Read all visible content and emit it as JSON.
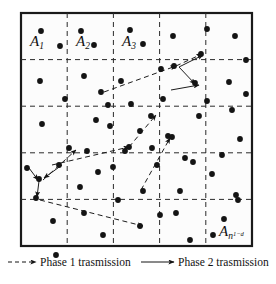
{
  "figure": {
    "type": "network-diagram",
    "frame": {
      "x": 21,
      "y": 13,
      "width": 231,
      "height": 233,
      "stroke_color": "#1a1a1a",
      "stroke_width": 2.2,
      "fill_color": "#fcfcfc"
    },
    "grid": {
      "rows": 5,
      "columns": 5,
      "line_style": "dashed",
      "stroke_color": "#2b2b2b",
      "dash_pattern": "5,4",
      "vertical_lines_x": [
        67.2,
        113.4,
        159.6,
        205.8
      ],
      "horizontal_lines_y": [
        59.6,
        106.2,
        152.8,
        199.4
      ]
    },
    "cell_labels": [
      {
        "id": "A1",
        "base": "A",
        "sub": "1",
        "subsup": "",
        "x": 30,
        "y": 46
      },
      {
        "id": "A2",
        "base": "A",
        "sub": "2",
        "subsup": "",
        "x": 76,
        "y": 46
      },
      {
        "id": "A3",
        "base": "A",
        "sub": "3",
        "subsup": "",
        "x": 122,
        "y": 46
      },
      {
        "id": "An",
        "base": "A",
        "sub": "n",
        "subsup": "1−d",
        "x": 219,
        "y": 236
      }
    ],
    "nodes": {
      "radius": 2.9,
      "color": "#141414",
      "count": 71,
      "points": [
        [
          41,
          31
        ],
        [
          60,
          46
        ],
        [
          81,
          31
        ],
        [
          94,
          45
        ],
        [
          130,
          30
        ],
        [
          143,
          44
        ],
        [
          173,
          36
        ],
        [
          201,
          54
        ],
        [
          207,
          29
        ],
        [
          235,
          36
        ],
        [
          40,
          81
        ],
        [
          84,
          76
        ],
        [
          101,
          92
        ],
        [
          65,
          99
        ],
        [
          121,
          81
        ],
        [
          108,
          105
        ],
        [
          161,
          69
        ],
        [
          174,
          66
        ],
        [
          195,
          83
        ],
        [
          229,
          82
        ],
        [
          246,
          94
        ],
        [
          42,
          124
        ],
        [
          110,
          126
        ],
        [
          140,
          131
        ],
        [
          129,
          147
        ],
        [
          152,
          148
        ],
        [
          163,
          99
        ],
        [
          172,
          137
        ],
        [
          185,
          158
        ],
        [
          199,
          116
        ],
        [
          240,
          139
        ],
        [
          27,
          168
        ],
        [
          39,
          179
        ],
        [
          59,
          165
        ],
        [
          80,
          187
        ],
        [
          98,
          172
        ],
        [
          125,
          151
        ],
        [
          143,
          191
        ],
        [
          180,
          191
        ],
        [
          212,
          174
        ],
        [
          236,
          195
        ],
        [
          193,
          162
        ],
        [
          36,
          198
        ],
        [
          118,
          200
        ],
        [
          157,
          165
        ],
        [
          168,
          136
        ],
        [
          53,
          221
        ],
        [
          84,
          213
        ],
        [
          103,
          235
        ],
        [
          140,
          226
        ],
        [
          176,
          213
        ],
        [
          224,
          219
        ],
        [
          190,
          240
        ],
        [
          238,
          200
        ],
        [
          96,
          120
        ],
        [
          131,
          104
        ],
        [
          151,
          116
        ],
        [
          207,
          101
        ],
        [
          222,
          155
        ],
        [
          69,
          148
        ],
        [
          87,
          151
        ],
        [
          113,
          167
        ],
        [
          160,
          215
        ],
        [
          213,
          235
        ],
        [
          246,
          60
        ],
        [
          232,
          110
        ],
        [
          56,
          255
        ]
      ]
    },
    "phase1": {
      "label_key": "legend.items.0.label",
      "style": "dashed",
      "stroke_color": "#1c1c1c",
      "stroke_width": 1.0,
      "dash_pattern": "5,3.5",
      "paths": [
        [
          [
            104,
            92
          ],
          [
            176,
            66
          ]
        ],
        [
          [
            176,
            66
          ],
          [
            202,
            54
          ]
        ],
        [
          [
            52,
            165
          ],
          [
            129,
            147
          ]
        ],
        [
          [
            129,
            147
          ],
          [
            156,
            115
          ]
        ],
        [
          [
            43,
            180
          ],
          [
            76,
            150
          ]
        ],
        [
          [
            40,
            200
          ],
          [
            143,
            226
          ]
        ],
        [
          [
            141,
            190
          ],
          [
            170,
            138
          ]
        ]
      ]
    },
    "phase2": {
      "label_key": "legend.items.1.label",
      "style": "solid",
      "stroke_color": "#1c1c1c",
      "stroke_width": 1.0,
      "paths": [
        [
          [
            179,
            67
          ],
          [
            203,
            55
          ]
        ],
        [
          [
            179,
            67
          ],
          [
            195,
            84
          ]
        ],
        [
          [
            171,
            90
          ],
          [
            199,
            85
          ]
        ],
        [
          [
            29,
            168
          ],
          [
            38,
            180
          ]
        ],
        [
          [
            62,
            165
          ],
          [
            44,
            178
          ]
        ],
        [
          [
            39,
            181
          ],
          [
            37,
            197
          ]
        ]
      ]
    },
    "arrow_markers": {
      "size": 5.5,
      "color": "#141414"
    }
  },
  "legend": {
    "y": 266,
    "items": [
      {
        "id": "phase-1",
        "label": "Phase 1 trasmission",
        "line_style": "dashed",
        "line_x1": 8,
        "line_x2": 36,
        "text_x": 40
      },
      {
        "id": "phase-2",
        "label": "Phase 2 trasmission",
        "line_style": "solid",
        "line_x1": 141,
        "line_x2": 174,
        "text_x": 178
      }
    ]
  },
  "colors": {
    "ink": "#141414",
    "frame": "#1a1a1a",
    "grid": "#2b2b2b",
    "background": "#ffffff",
    "panel": "#fcfcfc"
  }
}
